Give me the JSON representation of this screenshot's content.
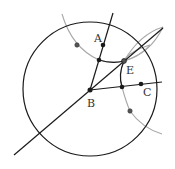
{
  "diagram": {
    "type": "geometric-construction",
    "points": [
      {
        "id": "A",
        "label": "A"
      },
      {
        "id": "B",
        "label": "B"
      },
      {
        "id": "C",
        "label": "C"
      },
      {
        "id": "E",
        "label": "E"
      }
    ],
    "colors": {
      "ink": "#1a1a1a",
      "construction": "#a8a8a8",
      "background": "#ffffff"
    }
  }
}
